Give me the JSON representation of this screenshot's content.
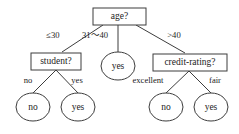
{
  "diagram": {
    "type": "decision-tree",
    "colors": {
      "stroke": "#3d3d3d",
      "text": "#1c1c1c",
      "background": "#ffffff"
    },
    "nodes": {
      "root": {
        "label": "age?",
        "shape": "rect"
      },
      "student": {
        "label": "student?",
        "shape": "rect"
      },
      "middle_leaf": {
        "label": "yes",
        "shape": "ellipse"
      },
      "credit_rating": {
        "label": "credit-rating?",
        "shape": "rect"
      },
      "student_no_leaf": {
        "label": "no",
        "shape": "ellipse"
      },
      "student_yes_leaf": {
        "label": "yes",
        "shape": "ellipse"
      },
      "credit_excellent_leaf": {
        "label": "no",
        "shape": "ellipse"
      },
      "credit_fair_leaf": {
        "label": "yes",
        "shape": "ellipse"
      }
    },
    "edges": {
      "age_le_30": "≤30",
      "age_31_40": "31～40",
      "age_gt_40": ">40",
      "student_no": "no",
      "student_yes": "yes",
      "credit_excellent": "excellent",
      "credit_fair": "fair"
    }
  }
}
